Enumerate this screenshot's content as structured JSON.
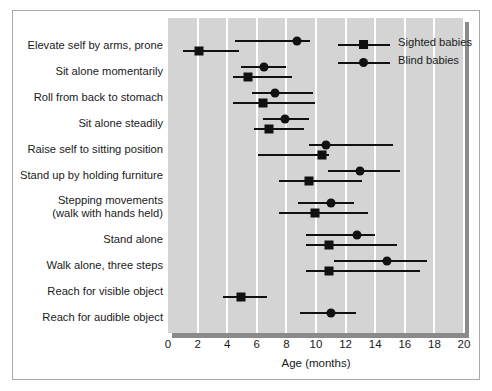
{
  "chart_data": {
    "type": "scatter",
    "title": "",
    "xlabel": "Age (months)",
    "ylabel": "",
    "xlim": [
      0,
      20
    ],
    "xticks": [
      0,
      2,
      4,
      6,
      8,
      10,
      12,
      14,
      16,
      18,
      20
    ],
    "xtick_labels": [
      "0",
      "2",
      "4",
      "6",
      "8",
      "10",
      "12",
      "14",
      "16",
      "18",
      "20"
    ],
    "grid": "vertical-white-gridlines-at-xticks",
    "legend_position": "upper-right-inside-plot",
    "plot_background": "#d4d4d4",
    "marker_color": "#111111",
    "categories": [
      "Elevate self by arms, prone",
      "Sit alone momentarily",
      "Roll from back to stomach",
      "Sit alone steadily",
      "Raise self to sitting position",
      "Stand up by holding furniture",
      "Stepping movements\n(walk with hands held)",
      "Stand alone",
      "Walk alone, three steps",
      "Reach for visible object",
      "Reach for audible object"
    ],
    "series": [
      {
        "name": "Sighted babies",
        "marker": "square",
        "points": [
          {
            "category": "Elevate self by arms, prone",
            "value": 2.1,
            "low": 1.0,
            "high": 4.8
          },
          {
            "category": "Sit alone momentarily",
            "value": 5.4,
            "low": 4.4,
            "high": 8.4
          },
          {
            "category": "Roll from back to stomach",
            "value": 6.4,
            "low": 4.4,
            "high": 9.9
          },
          {
            "category": "Sit alone steadily",
            "value": 6.8,
            "low": 5.8,
            "high": 9.2
          },
          {
            "category": "Raise self to sitting position",
            "value": 10.4,
            "low": 6.1,
            "high": 10.9
          },
          {
            "category": "Stand up by holding furniture",
            "value": 9.5,
            "low": 7.5,
            "high": 13.1
          },
          {
            "category": "Stepping movements\n(walk with hands held)",
            "value": 9.9,
            "low": 7.5,
            "high": 13.5
          },
          {
            "category": "Stand alone",
            "value": 10.9,
            "low": 9.3,
            "high": 15.5
          },
          {
            "category": "Walk alone, three steps",
            "value": 10.9,
            "low": 9.3,
            "high": 17.0
          },
          {
            "category": "Reach for visible object",
            "value": 4.9,
            "low": 3.7,
            "high": 6.7
          },
          {
            "category": "Reach for audible object",
            "value": null,
            "low": null,
            "high": null
          }
        ]
      },
      {
        "name": "Blind babies",
        "marker": "circle",
        "points": [
          {
            "category": "Elevate self by arms, prone",
            "value": 8.7,
            "low": 4.5,
            "high": 9.6
          },
          {
            "category": "Sit alone momentarily",
            "value": 6.5,
            "low": 4.9,
            "high": 8.0
          },
          {
            "category": "Roll from back to stomach",
            "value": 7.2,
            "low": 5.7,
            "high": 9.8
          },
          {
            "category": "Sit alone steadily",
            "value": 7.9,
            "low": 6.4,
            "high": 9.5
          },
          {
            "category": "Raise self to sitting position",
            "value": 10.7,
            "low": 9.5,
            "high": 15.2
          },
          {
            "category": "Stand up by holding furniture",
            "value": 13.0,
            "low": 10.8,
            "high": 15.7
          },
          {
            "category": "Stepping movements\n(walk with hands held)",
            "value": 11.0,
            "low": 8.8,
            "high": 12.6
          },
          {
            "category": "Stand alone",
            "value": 12.8,
            "low": 9.3,
            "high": 14.0
          },
          {
            "category": "Walk alone, three steps",
            "value": 14.8,
            "low": 11.2,
            "high": 17.5
          },
          {
            "category": "Reach for visible object",
            "value": null,
            "low": null,
            "high": null
          },
          {
            "category": "Reach for audible object",
            "value": 11.0,
            "low": 8.9,
            "high": 12.7
          }
        ]
      }
    ]
  }
}
